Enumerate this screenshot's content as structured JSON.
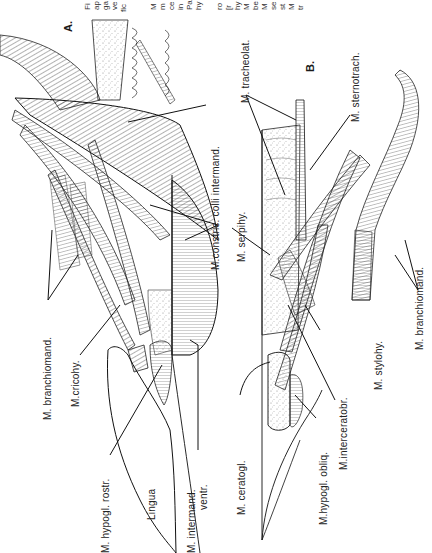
{
  "figure": {
    "orientation": "rotated 90 degrees counter-clockwise",
    "panels": [
      {
        "id": "A",
        "label": "A.",
        "structures": [
          "M. branchiomand.",
          "M.cricohy.",
          "M. hypogl. rostr.",
          "Lingua",
          "M. intermand.",
          "ventr.",
          "M.constric. colli intermand.",
          "M. serpihy."
        ]
      },
      {
        "id": "B",
        "label": "B.",
        "structures": [
          "M. tracheolat.",
          "M. sternotrach.",
          "M. serpihy.",
          "M. stylohy.",
          "M. branchiomand.",
          "M. ceratogl.",
          "M.hypogl. obliq.",
          "M.interceratobr."
        ]
      }
    ],
    "caption_fragments": {
      "col1": [
        "Fi",
        "ap",
        "ga",
        "ve",
        "fic"
      ],
      "col2": [
        "M",
        "m",
        "ce",
        "in",
        "Pa",
        "hy",
        "ro",
        "[r",
        "hy",
        "M",
        "be",
        "M",
        "se",
        "st",
        "M",
        "tr"
      ]
    }
  },
  "labels": {
    "panel_a": "A.",
    "panel_b": "B.",
    "a_branchiomand": "M. branchiomand.",
    "a_cricohy": "M.cricohy.",
    "a_hypogl_rostr": "M. hypogl. rostr.",
    "a_lingua": "Lingua",
    "a_intermand": "M. intermand.",
    "a_ventr": "ventr.",
    "a_constric": "M.constric. colli intermand.",
    "serpihy": "M. serpihy.",
    "b_tracheolat": "M. tracheolat.",
    "b_sternotrach": "M. sternotrach.",
    "b_stylohy": "M. stylohy.",
    "b_branchiomand": "M. branchiomand.",
    "b_ceratogl": "M. ceratogl.",
    "b_hypogl_obliq": "M.hypogl. obliq.",
    "b_interceratobr": "M.interceratobr."
  },
  "caption": {
    "c1_0": "Fi",
    "c1_1": "ap",
    "c1_2": "ga",
    "c1_3": "ve",
    "c1_4": "fic",
    "c2_0": "M",
    "c2_1": "m",
    "c2_2": "ce",
    "c2_3": "in",
    "c2_4": "Pa",
    "c2_5": "hy",
    "c2_6": "ro",
    "c2_7": "[r",
    "c2_8": "hy",
    "c2_9": "M",
    "c2_10": "be",
    "c2_11": "M",
    "c2_12": "se",
    "c2_13": "st",
    "c2_14": "M",
    "c2_15": "tr"
  },
  "colors": {
    "ink": "#1a1a1a",
    "paper": "#ffffff",
    "stipple": "#8a8a8a"
  }
}
